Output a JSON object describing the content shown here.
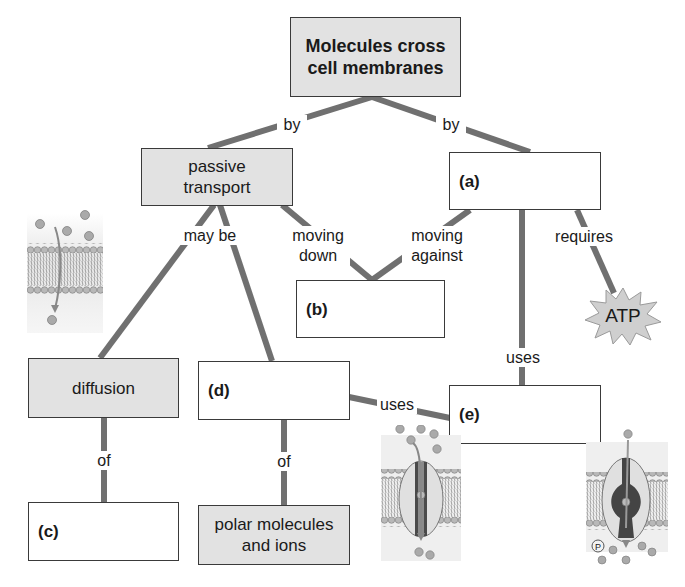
{
  "nodes": {
    "root": "Molecules cross cell membranes",
    "passive": "passive transport",
    "a": "(a)",
    "b": "(b)",
    "diffusion": "diffusion",
    "d": "(d)",
    "e": "(e)",
    "c": "(c)",
    "polar": "polar molecules and ions",
    "atp": "ATP"
  },
  "links": {
    "by_left": "by",
    "by_right": "by",
    "may_be": "may be",
    "moving_down": "moving down",
    "moving_against": "moving against",
    "requires": "requires",
    "uses_a_e": "uses",
    "uses_d_e": "uses",
    "of_diffusion": "of",
    "of_d": "of"
  },
  "illustrations": {
    "diffusion": "membrane-simple-diffusion",
    "channel": "channel-protein",
    "pump": "transport-pump-with-phosphate"
  },
  "colors": {
    "line": "#707070",
    "shaded_box": "#e2e2e2",
    "border": "#3a3a3a",
    "atp_burst": "#cfcfcf"
  }
}
